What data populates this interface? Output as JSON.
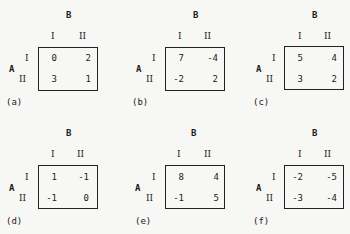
{
  "figure": {
    "row_player": "A",
    "col_player": "B",
    "strategy_labels": [
      "I",
      "II"
    ],
    "matrices": [
      {
        "caption": "(a)",
        "values": [
          [
            "0",
            "2"
          ],
          [
            "3",
            "1"
          ]
        ]
      },
      {
        "caption": "(b)",
        "values": [
          [
            "7",
            "-4"
          ],
          [
            "-2",
            "2"
          ]
        ]
      },
      {
        "caption": "(c)",
        "values": [
          [
            "5",
            "4"
          ],
          [
            "3",
            "2"
          ]
        ]
      },
      {
        "caption": "(d)",
        "values": [
          [
            "1",
            "-1"
          ],
          [
            "-1",
            "0"
          ]
        ]
      },
      {
        "caption": "(e)",
        "values": [
          [
            "8",
            "4"
          ],
          [
            "-1",
            "5"
          ]
        ]
      },
      {
        "caption": "(f)",
        "values": [
          [
            "-2",
            "-5"
          ],
          [
            "-3",
            "-4"
          ]
        ]
      }
    ]
  }
}
